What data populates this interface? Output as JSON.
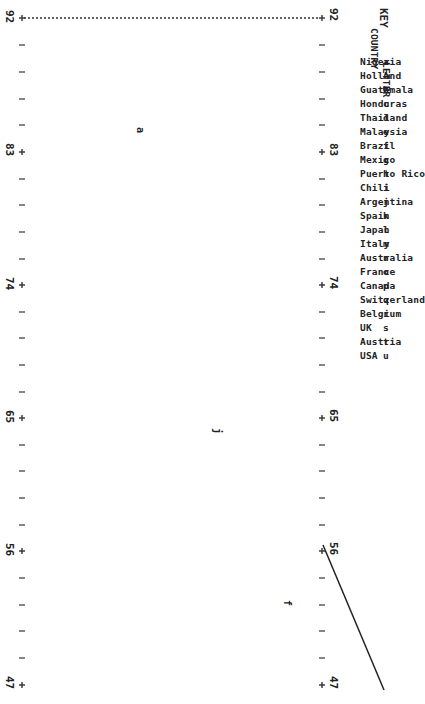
{
  "chart_data": {
    "type": "scatter",
    "title": "",
    "orientation": "rotated 90 degrees clockwise (line-printer style plot)",
    "value_axis": {
      "ticks": [
        "92",
        "83",
        "74",
        "65",
        "56",
        "47"
      ],
      "range": [
        47,
        92
      ],
      "minor_tick_glyph": "I",
      "major_tick_glyph": "+"
    },
    "points": [
      {
        "letter": "a",
        "country": "Nigeria",
        "value": 86,
        "position": "upper-left region"
      },
      {
        "letter": "j",
        "country": "Argentina",
        "value": 68,
        "position": "middle"
      },
      {
        "letter": "f",
        "country": "Brazil",
        "value": 50,
        "position": "lower-right"
      }
    ],
    "line": {
      "from_value": 57,
      "to_value": 47,
      "description": "diagonal line descending toward lower right"
    },
    "legend": {
      "title": "KEY",
      "columns": [
        "COUNTRY",
        "LETTER"
      ],
      "entries": [
        {
          "country": "Nigeria",
          "letter": "a"
        },
        {
          "country": "Holland",
          "letter": "A"
        },
        {
          "country": "Guatemala",
          "letter": "b"
        },
        {
          "country": "Honduras",
          "letter": "c"
        },
        {
          "country": "Thailand",
          "letter": "d"
        },
        {
          "country": "Malaysia",
          "letter": "e"
        },
        {
          "country": "Brazil",
          "letter": "f"
        },
        {
          "country": "Mexico",
          "letter": "g"
        },
        {
          "country": "Puerto Rico",
          "letter": "h"
        },
        {
          "country": "Chili",
          "letter": "i"
        },
        {
          "country": "Argentina",
          "letter": "j"
        },
        {
          "country": "Spain",
          "letter": "k"
        },
        {
          "country": "Japan",
          "letter": "l"
        },
        {
          "country": "Italy",
          "letter": "m"
        },
        {
          "country": "Australia",
          "letter": "n"
        },
        {
          "country": "France",
          "letter": "o"
        },
        {
          "country": "Canada",
          "letter": "p"
        },
        {
          "country": "Switzerland",
          "letter": "q"
        },
        {
          "country": "Belgium",
          "letter": "r"
        },
        {
          "country": "UK",
          "letter": "s"
        },
        {
          "country": "Austria",
          "letter": "t"
        },
        {
          "country": "USA",
          "letter": "u"
        }
      ],
      "position": "right"
    }
  },
  "axis": {
    "left_labels": [
      "92",
      "83",
      "74",
      "65",
      "56",
      "47"
    ],
    "right_labels": [
      "92",
      "83",
      "74",
      "65",
      "56",
      "47"
    ]
  },
  "key": {
    "title": "KEY",
    "col_country": "COUNTRY",
    "col_letter": "LETTER"
  },
  "points": {
    "a": "a",
    "j": "j",
    "f": "f"
  }
}
